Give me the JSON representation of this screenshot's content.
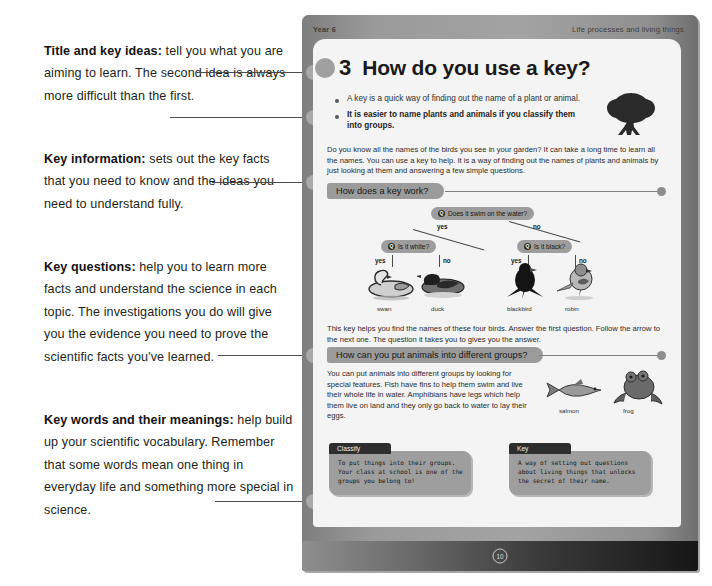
{
  "annotations": [
    {
      "id": "title-and-key-ideas",
      "bold": "Title and key ideas:",
      "rest": " tell you what you are aiming to learn. The second idea is always more difficult than the first."
    },
    {
      "id": "key-information",
      "bold": "Key information:",
      "rest": " sets out the key facts that you need to know and the ideas you need to understand fully."
    },
    {
      "id": "key-questions",
      "bold": "Key questions:",
      "rest": " help you to learn more facts and understand the science in each topic. The investigations you do will give you the evidence you need to prove the scientific facts you've learned."
    },
    {
      "id": "key-words-and-their-meanings",
      "bold": "Key words and their meanings:",
      "rest": " help build up your scientific vocabulary. Remember that some words mean one thing in everyday life and something more special in science."
    }
  ],
  "page": {
    "runhead_left": "Year 6",
    "runhead_right": "Life processes and living things",
    "title_number": "3",
    "title_text": "How do you use a key?",
    "key_ideas": [
      {
        "text": "A key is a quick way of finding out the name of a plant or animal.",
        "bold": false
      },
      {
        "text": "It is easier to name plants and animals if you classify them into groups.",
        "bold": true
      }
    ],
    "intro_paragraph": "Do you know all the names of the birds you see in your garden? It can take a long time to learn all the names. You can use a key to help. It is a way of finding out the names of plants and animals by just looking at them and answering a few simple questions.",
    "section_1_heading": "How does a key work?",
    "key_diagram": {
      "root_question": "Does it swim on the water?",
      "left_branch_label": "yes",
      "right_branch_label": "no",
      "left_question": "Is it white?",
      "right_question": "Is it black?",
      "leaf_labels": [
        "yes",
        "no",
        "yes",
        "no"
      ],
      "animals": [
        "swan",
        "duck",
        "blackbird",
        "robin"
      ]
    },
    "key_caption": "This key helps you find the names of these four birds. Answer the first question. Follow the arrow to the next one. The question it takes you to gives you the answer.",
    "section_2_heading": "How can you put animals into different groups?",
    "groups_paragraph": "You can put animals into different groups by looking for special features. Fish have fins to help them swim and live their whole life in water. Amphibians have legs which help them live on land and they only go back to water to lay their eggs.",
    "groups_animals": [
      "salmon",
      "frog"
    ],
    "glossary": [
      {
        "term": "Classify",
        "definition": "To put things into their groups. Your class at school is one of the groups you belong to!"
      },
      {
        "term": "Key",
        "definition": "A way of setting out questions about living things that unlocks the secret of their name."
      }
    ],
    "page_number": "10"
  },
  "colors": {
    "page_grey": "#8d8d8d",
    "card_grey": "#f4f4f4",
    "pill_grey": "#9b9b9b",
    "ink": "#231f20"
  }
}
